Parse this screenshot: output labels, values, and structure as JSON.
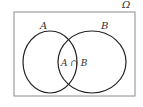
{
  "diagram": {
    "type": "venn",
    "universe_label": "Ω",
    "sets": [
      {
        "label": "A"
      },
      {
        "label": "B"
      }
    ],
    "intersection_label": "A ∩ B",
    "colors": {
      "stroke": "#222222",
      "frame": "#888888",
      "background": "#ffffff"
    }
  }
}
